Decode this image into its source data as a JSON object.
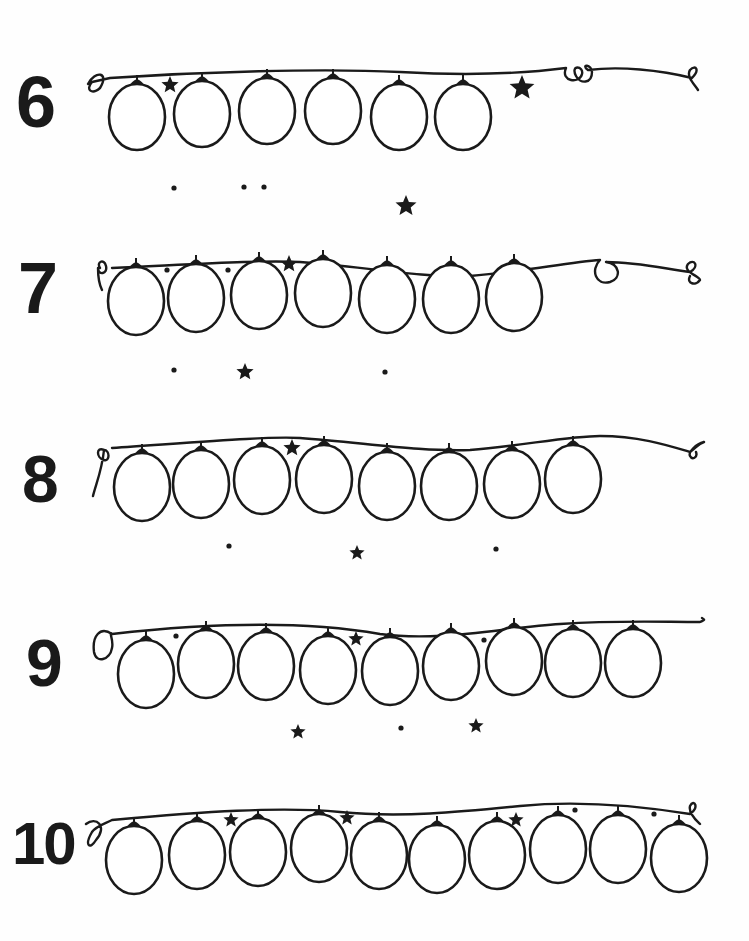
{
  "worksheet": {
    "type": "counting worksheet",
    "ink_color": "#1a1a1a",
    "background_color": "#ffffff",
    "rows": [
      {
        "number_label": "6",
        "bulb_count": 6,
        "numeral": {
          "x": 16,
          "y": 66,
          "size": 72
        },
        "string": "M88 84 C 95 70, 110 72, 100 88 C 92 95, 85 90, 92 82 L 110 78 C 200 72, 320 68, 400 72 C 470 76, 520 74, 566 68 C 560 82, 580 84, 582 74 C 584 66, 570 64, 576 76 C 580 84, 592 84, 592 72 C 592 64, 580 64, 588 70 C 620 66, 660 70, 692 78 C 700 70, 696 64, 690 70 C 686 76, 694 84, 698 90",
        "bulbs": [
          {
            "cx": 137,
            "cy": 117,
            "rx": 28,
            "ry": 33
          },
          {
            "cx": 202,
            "cy": 114,
            "rx": 28,
            "ry": 33
          },
          {
            "cx": 267,
            "cy": 111,
            "rx": 28,
            "ry": 33
          },
          {
            "cx": 333,
            "cy": 111,
            "rx": 28,
            "ry": 33
          },
          {
            "cx": 399,
            "cy": 117,
            "rx": 28,
            "ry": 33
          },
          {
            "cx": 463,
            "cy": 117,
            "rx": 28,
            "ry": 33
          }
        ],
        "stars": [
          {
            "x": 170,
            "y": 85,
            "size": 9
          },
          {
            "x": 522,
            "y": 88,
            "size": 13
          },
          {
            "x": 406,
            "y": 206,
            "size": 11
          }
        ],
        "dots": [
          {
            "x": 174,
            "y": 188
          },
          {
            "x": 244,
            "y": 187
          },
          {
            "x": 264,
            "y": 187
          }
        ]
      },
      {
        "number_label": "7",
        "bulb_count": 7,
        "numeral": {
          "x": 18,
          "y": 252,
          "size": 72
        },
        "string": "M100 268 C 96 262, 104 258, 106 266 C 108 274, 98 276, 98 268 C 98 280, 100 286, 102 290 M112 268 C 200 264, 260 260, 300 262 C 360 266, 420 278, 470 276 C 520 272, 570 262, 600 260 C 590 270, 596 286, 610 282 C 622 278, 620 264, 606 262 C 640 262, 670 270, 690 272 C 700 266, 694 258, 688 264 C 682 272, 700 276, 700 280 C 696 286, 686 284, 690 276",
        "bulbs": [
          {
            "cx": 136,
            "cy": 301,
            "rx": 28,
            "ry": 34
          },
          {
            "cx": 196,
            "cy": 298,
            "rx": 28,
            "ry": 34
          },
          {
            "cx": 259,
            "cy": 295,
            "rx": 28,
            "ry": 34
          },
          {
            "cx": 323,
            "cy": 293,
            "rx": 28,
            "ry": 34
          },
          {
            "cx": 387,
            "cy": 299,
            "rx": 28,
            "ry": 34
          },
          {
            "cx": 451,
            "cy": 299,
            "rx": 28,
            "ry": 34
          },
          {
            "cx": 514,
            "cy": 297,
            "rx": 28,
            "ry": 34
          }
        ],
        "stars": [
          {
            "x": 289,
            "y": 264,
            "size": 9
          },
          {
            "x": 245,
            "y": 372,
            "size": 9
          }
        ],
        "dots": [
          {
            "x": 167,
            "y": 270
          },
          {
            "x": 228,
            "y": 270
          },
          {
            "x": 174,
            "y": 370
          },
          {
            "x": 385,
            "y": 372
          }
        ]
      },
      {
        "number_label": "8",
        "bulb_count": 8,
        "numeral": {
          "x": 22,
          "y": 446,
          "size": 66
        },
        "string": "M104 450 C 96 446, 96 458, 104 460 C 110 462, 110 450, 104 450 C 102 470, 96 484, 93 496 M112 448 C 200 442, 270 436, 300 438 C 360 442, 420 452, 470 450 C 520 446, 570 436, 600 436 C 640 436, 670 446, 690 452 C 696 448, 698 444, 704 442 C 696 444, 688 452, 690 456 C 692 460, 698 458, 696 452",
        "bulbs": [
          {
            "cx": 142,
            "cy": 487,
            "rx": 28,
            "ry": 34
          },
          {
            "cx": 201,
            "cy": 484,
            "rx": 28,
            "ry": 34
          },
          {
            "cx": 262,
            "cy": 480,
            "rx": 28,
            "ry": 34
          },
          {
            "cx": 324,
            "cy": 479,
            "rx": 28,
            "ry": 34
          },
          {
            "cx": 387,
            "cy": 486,
            "rx": 28,
            "ry": 34
          },
          {
            "cx": 449,
            "cy": 486,
            "rx": 28,
            "ry": 34
          },
          {
            "cx": 512,
            "cy": 484,
            "rx": 28,
            "ry": 34
          },
          {
            "cx": 573,
            "cy": 479,
            "rx": 28,
            "ry": 34
          }
        ],
        "stars": [
          {
            "x": 292,
            "y": 448,
            "size": 9
          },
          {
            "x": 357,
            "y": 553,
            "size": 8
          }
        ],
        "dots": [
          {
            "x": 229,
            "y": 546
          },
          {
            "x": 496,
            "y": 549
          }
        ]
      },
      {
        "number_label": "9",
        "bulb_count": 9,
        "numeral": {
          "x": 26,
          "y": 630,
          "size": 66
        },
        "string": "M112 634 C 100 626, 92 636, 94 652 C 96 664, 110 660, 112 648 C 114 640, 108 630, 112 634 M112 634 C 200 624, 300 620, 380 634 C 440 642, 500 628, 560 624 C 620 620, 660 622, 700 622 C 704 620, 706 620, 702 618",
        "bulbs": [
          {
            "cx": 146,
            "cy": 674,
            "rx": 28,
            "ry": 34
          },
          {
            "cx": 206,
            "cy": 664,
            "rx": 28,
            "ry": 34
          },
          {
            "cx": 266,
            "cy": 666,
            "rx": 28,
            "ry": 34
          },
          {
            "cx": 328,
            "cy": 670,
            "rx": 28,
            "ry": 34
          },
          {
            "cx": 390,
            "cy": 671,
            "rx": 28,
            "ry": 34
          },
          {
            "cx": 451,
            "cy": 666,
            "rx": 28,
            "ry": 34
          },
          {
            "cx": 514,
            "cy": 661,
            "rx": 28,
            "ry": 34
          },
          {
            "cx": 573,
            "cy": 663,
            "rx": 28,
            "ry": 34
          },
          {
            "cx": 633,
            "cy": 663,
            "rx": 28,
            "ry": 34
          }
        ],
        "stars": [
          {
            "x": 356,
            "y": 639,
            "size": 8
          },
          {
            "x": 298,
            "y": 732,
            "size": 8
          },
          {
            "x": 476,
            "y": 726,
            "size": 8
          }
        ],
        "dots": [
          {
            "x": 176,
            "y": 636
          },
          {
            "x": 484,
            "y": 640
          },
          {
            "x": 401,
            "y": 728
          }
        ]
      },
      {
        "number_label": "10",
        "bulb_count": 10,
        "numeral": {
          "x": 12,
          "y": 814,
          "size": 60
        },
        "string": "M86 824 C 96 816, 108 826, 96 840 C 90 850, 84 846, 92 832 C 96 826, 104 824, 112 820 C 200 812, 280 806, 340 812 C 400 818, 460 812, 520 806 C 580 800, 640 806, 690 814 C 700 808, 694 798, 690 806 C 688 814, 698 822, 700 824",
        "bulbs": [
          {
            "cx": 134,
            "cy": 860,
            "rx": 28,
            "ry": 34
          },
          {
            "cx": 197,
            "cy": 855,
            "rx": 28,
            "ry": 34
          },
          {
            "cx": 258,
            "cy": 852,
            "rx": 28,
            "ry": 34
          },
          {
            "cx": 319,
            "cy": 848,
            "rx": 28,
            "ry": 34
          },
          {
            "cx": 379,
            "cy": 855,
            "rx": 28,
            "ry": 34
          },
          {
            "cx": 437,
            "cy": 859,
            "rx": 28,
            "ry": 34
          },
          {
            "cx": 497,
            "cy": 855,
            "rx": 28,
            "ry": 34
          },
          {
            "cx": 558,
            "cy": 849,
            "rx": 28,
            "ry": 34
          },
          {
            "cx": 618,
            "cy": 849,
            "rx": 28,
            "ry": 34
          },
          {
            "cx": 679,
            "cy": 858,
            "rx": 28,
            "ry": 34
          }
        ],
        "stars": [
          {
            "x": 231,
            "y": 820,
            "size": 8
          },
          {
            "x": 347,
            "y": 818,
            "size": 8
          },
          {
            "x": 516,
            "y": 820,
            "size": 8
          }
        ],
        "dots": [
          {
            "x": 575,
            "y": 810
          },
          {
            "x": 654,
            "y": 814
          }
        ]
      }
    ]
  }
}
